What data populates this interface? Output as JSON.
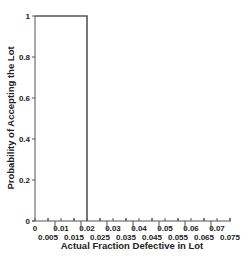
{
  "chart_data": {
    "type": "line",
    "title": "",
    "xlabel": "Actual Fraction Defective in Lot",
    "ylabel": "Probability of Accepting the Lot",
    "xlim": [
      0,
      0.075
    ],
    "ylim": [
      0,
      1
    ],
    "grid": false,
    "legend": null,
    "x_ticks_upper": [
      "0",
      "0.01",
      "0.02",
      "0.03",
      "0.04",
      "0.05",
      "0.06",
      "0.07"
    ],
    "x_ticks_lower": [
      "0.005",
      "0.015",
      "0.025",
      "0.035",
      "0.045",
      "0.055",
      "0.065",
      "0.075"
    ],
    "y_ticks": [
      "0",
      "0.2",
      "0.4",
      "0.6",
      "0.8",
      "1"
    ],
    "series": [
      {
        "name": "Ideal OC curve",
        "x": [
          0,
          0.02,
          0.02
        ],
        "y": [
          1,
          1,
          0
        ],
        "color": "#555555"
      }
    ]
  }
}
